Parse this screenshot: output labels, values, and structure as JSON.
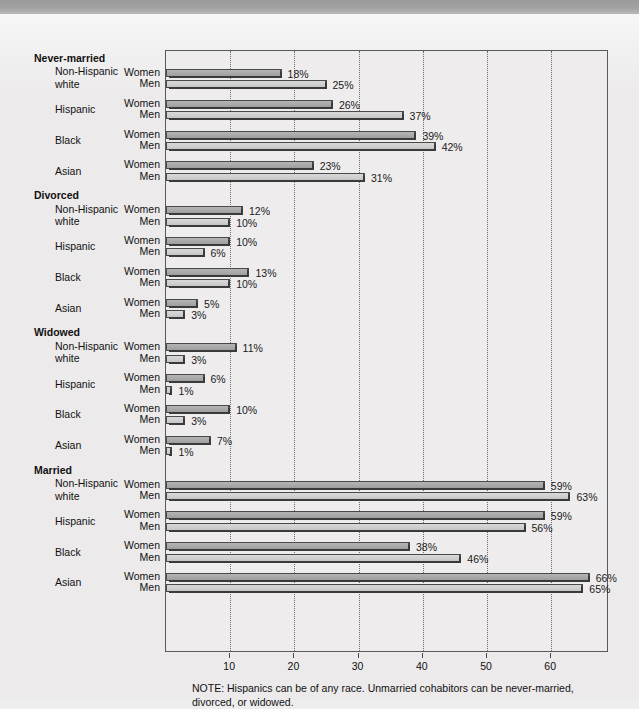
{
  "chart_data": {
    "type": "bar",
    "orientation": "horizontal",
    "title": "",
    "xlabel": "",
    "ylabel": "",
    "xlim": [
      0,
      69
    ],
    "xticks": [
      10,
      20,
      30,
      40,
      50,
      60
    ],
    "grid": true,
    "grid_style": "dotted vertical",
    "legend": "none",
    "value_suffix": "%",
    "series": [
      {
        "name": "Women",
        "color": "#a8a8a8"
      },
      {
        "name": "Men",
        "color": "#cfcfcf"
      }
    ],
    "sections": [
      {
        "label": "Never-married",
        "groups": [
          {
            "label": "Non-Hispanic\nwhite",
            "line1": "Non-Hispanic",
            "line2": "white",
            "rows": [
              {
                "sex": "Women",
                "value": 18,
                "value_label": "18%"
              },
              {
                "sex": "Men",
                "value": 25,
                "value_label": "25%"
              }
            ]
          },
          {
            "label": "Hispanic",
            "line1": "Hispanic",
            "line2": "",
            "rows": [
              {
                "sex": "Women",
                "value": 26,
                "value_label": "26%"
              },
              {
                "sex": "Men",
                "value": 37,
                "value_label": "37%"
              }
            ]
          },
          {
            "label": "Black",
            "line1": "Black",
            "line2": "",
            "rows": [
              {
                "sex": "Women",
                "value": 39,
                "value_label": "39%"
              },
              {
                "sex": "Men",
                "value": 42,
                "value_label": "42%"
              }
            ]
          },
          {
            "label": "Asian",
            "line1": "Asian",
            "line2": "",
            "rows": [
              {
                "sex": "Women",
                "value": 23,
                "value_label": "23%"
              },
              {
                "sex": "Men",
                "value": 31,
                "value_label": "31%"
              }
            ]
          }
        ]
      },
      {
        "label": "Divorced",
        "groups": [
          {
            "label": "Non-Hispanic\nwhite",
            "line1": "Non-Hispanic",
            "line2": "white",
            "rows": [
              {
                "sex": "Women",
                "value": 12,
                "value_label": "12%"
              },
              {
                "sex": "Men",
                "value": 10,
                "value_label": "10%"
              }
            ]
          },
          {
            "label": "Hispanic",
            "line1": "Hispanic",
            "line2": "",
            "rows": [
              {
                "sex": "Women",
                "value": 10,
                "value_label": "10%"
              },
              {
                "sex": "Men",
                "value": 6,
                "value_label": "6%"
              }
            ]
          },
          {
            "label": "Black",
            "line1": "Black",
            "line2": "",
            "rows": [
              {
                "sex": "Women",
                "value": 13,
                "value_label": "13%"
              },
              {
                "sex": "Men",
                "value": 10,
                "value_label": "10%"
              }
            ]
          },
          {
            "label": "Asian",
            "line1": "Asian",
            "line2": "",
            "rows": [
              {
                "sex": "Women",
                "value": 5,
                "value_label": "5%"
              },
              {
                "sex": "Men",
                "value": 3,
                "value_label": "3%"
              }
            ]
          }
        ]
      },
      {
        "label": "Widowed",
        "groups": [
          {
            "label": "Non-Hispanic\nwhite",
            "line1": "Non-Hispanic",
            "line2": "white",
            "rows": [
              {
                "sex": "Women",
                "value": 11,
                "value_label": "11%"
              },
              {
                "sex": "Men",
                "value": 3,
                "value_label": "3%"
              }
            ]
          },
          {
            "label": "Hispanic",
            "line1": "Hispanic",
            "line2": "",
            "rows": [
              {
                "sex": "Women",
                "value": 6,
                "value_label": "6%"
              },
              {
                "sex": "Men",
                "value": 1,
                "value_label": "1%"
              }
            ]
          },
          {
            "label": "Black",
            "line1": "Black",
            "line2": "",
            "rows": [
              {
                "sex": "Women",
                "value": 10,
                "value_label": "10%"
              },
              {
                "sex": "Men",
                "value": 3,
                "value_label": "3%"
              }
            ]
          },
          {
            "label": "Asian",
            "line1": "Asian",
            "line2": "",
            "rows": [
              {
                "sex": "Women",
                "value": 7,
                "value_label": "7%"
              },
              {
                "sex": "Men",
                "value": 1,
                "value_label": "1%"
              }
            ]
          }
        ]
      },
      {
        "label": "Married",
        "groups": [
          {
            "label": "Non-Hispanic\nwhite",
            "line1": "Non-Hispanic",
            "line2": "white",
            "rows": [
              {
                "sex": "Women",
                "value": 59,
                "value_label": "59%"
              },
              {
                "sex": "Men",
                "value": 63,
                "value_label": "63%"
              }
            ]
          },
          {
            "label": "Hispanic",
            "line1": "Hispanic",
            "line2": "",
            "rows": [
              {
                "sex": "Women",
                "value": 59,
                "value_label": "59%"
              },
              {
                "sex": "Men",
                "value": 56,
                "value_label": "56%"
              }
            ]
          },
          {
            "label": "Black",
            "line1": "Black",
            "line2": "",
            "rows": [
              {
                "sex": "Women",
                "value": 38,
                "value_label": "38%"
              },
              {
                "sex": "Men",
                "value": 46,
                "value_label": "46%"
              }
            ]
          },
          {
            "label": "Asian",
            "line1": "Asian",
            "line2": "",
            "rows": [
              {
                "sex": "Women",
                "value": 66,
                "value_label": "66%"
              },
              {
                "sex": "Men",
                "value": 65,
                "value_label": "65%"
              }
            ]
          }
        ]
      }
    ]
  },
  "note": "NOTE: Hispanics can be of any race. Unmarried cohabitors can be never-married, divorced, or widowed."
}
